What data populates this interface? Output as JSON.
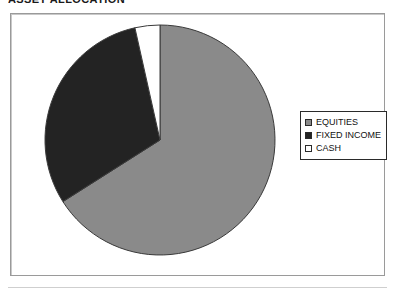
{
  "title": "ASSET ALLOCATION",
  "chart_frame": {
    "border_color": "#9a9a9a",
    "background": "#ffffff"
  },
  "legend": {
    "position": "right",
    "border_color": "#2a2a2a",
    "items": [
      {
        "label": "EQUITIES",
        "color": "#8a8a8a",
        "swatch_name": "legend-swatch-equities"
      },
      {
        "label": "FIXED INCOME",
        "color": "#232323",
        "swatch_name": "legend-swatch-fixed-income"
      },
      {
        "label": "CASH",
        "color": "#ffffff",
        "swatch_name": "legend-swatch-cash"
      }
    ]
  },
  "chart_data": {
    "type": "pie",
    "title": "ASSET ALLOCATION",
    "xlabel": "",
    "ylabel": "",
    "legend_position": "right",
    "grid": false,
    "start_angle_deg": 0,
    "direction": "clockwise",
    "center": {
      "x": 160,
      "y": 140
    },
    "radius": 115,
    "outline_color": "#3a3a3a",
    "categories": [
      "EQUITIES",
      "FIXED INCOME",
      "CASH"
    ],
    "values": [
      66,
      30.5,
      3.5
    ],
    "units": "percent",
    "slices": [
      {
        "label": "EQUITIES",
        "value": 66,
        "color": "#8a8a8a",
        "start_deg": 0,
        "end_deg": 237.6
      },
      {
        "label": "FIXED INCOME",
        "value": 30.5,
        "color": "#232323",
        "start_deg": 237.6,
        "end_deg": 347.4
      },
      {
        "label": "CASH",
        "value": 3.5,
        "color": "#ffffff",
        "start_deg": 347.4,
        "end_deg": 360
      }
    ]
  }
}
